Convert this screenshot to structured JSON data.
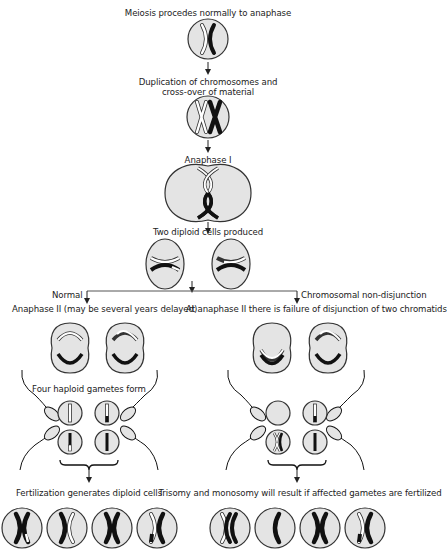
{
  "diagram": {
    "type": "flowchart",
    "topic": "Meiotic non-disjunction",
    "colors": {
      "cell_fill": "#e4e4e4",
      "outline": "#333333",
      "chromosome_dark": "#111111",
      "chromosome_light": "#ffffff",
      "arrow": "#222222"
    }
  },
  "steps": {
    "s1": "Meiosis procedes normally to anaphase",
    "s2_line1": "Duplication of chromosomes and",
    "s2_line2": "cross-over of material",
    "s3": "Anaphase I",
    "s4": "Two diploid cells produced"
  },
  "branches": {
    "normal": {
      "heading": "Normal",
      "subheading": "Anaphase II (may be several years delayed)",
      "gametes_label": "Four haploid gametes form",
      "result_label": "Fertilization generates diploid cells"
    },
    "nondisjunction": {
      "heading": "Chromosomal non-disjunction",
      "subheading": "At anaphase II there is failure of disjunction of two chromatids",
      "result_label": "Trisomy and monosomy will result if affected gametes are fertilized"
    }
  }
}
